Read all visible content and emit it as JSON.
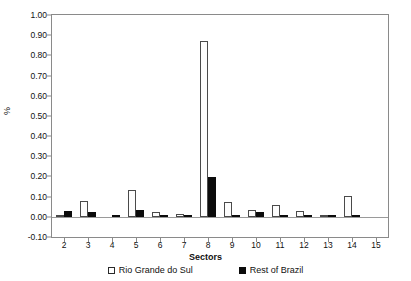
{
  "chart_data": {
    "type": "bar",
    "title": "",
    "xlabel": "Sectors",
    "ylabel": "%",
    "ylim": [
      -0.1,
      1.0
    ],
    "ytick_step": 0.1,
    "grid": false,
    "legend_position": "bottom",
    "categories": [
      "2",
      "3",
      "4",
      "5",
      "6",
      "7",
      "8",
      "9",
      "10",
      "11",
      "12",
      "13",
      "14",
      "15"
    ],
    "ytick_labels": [
      "1.00",
      "0.90",
      "0.80",
      "0.70",
      "0.60",
      "0.50",
      "0.40",
      "0.30",
      "0.20",
      "0.10",
      "0.00",
      "-0.10"
    ],
    "ytick_values": [
      1.0,
      0.9,
      0.8,
      0.7,
      0.6,
      0.5,
      0.4,
      0.3,
      0.2,
      0.1,
      0.0,
      -0.1
    ],
    "series": [
      {
        "name": "Rio Grande do Sul",
        "color": "#ffffff",
        "edge_color": "#4a4a4a",
        "values": [
          0.006,
          0.077,
          0.002,
          0.135,
          0.025,
          0.012,
          0.873,
          0.072,
          0.033,
          0.058,
          0.028,
          0.004,
          0.105,
          0.0
        ]
      },
      {
        "name": "Rest of Brazil",
        "color": "#0b0b0b",
        "edge_color": "#0b0b0b",
        "values": [
          0.031,
          0.022,
          0.01,
          0.032,
          0.005,
          0.004,
          0.198,
          0.005,
          0.022,
          0.006,
          0.005,
          0.006,
          0.006,
          0.0
        ]
      }
    ]
  },
  "legend": {
    "items": [
      {
        "label": "Rio Grande do Sul",
        "swatch": "hollow-square"
      },
      {
        "label": "Rest of Brazil",
        "swatch": "filled-square"
      }
    ]
  },
  "axes": {
    "x_title": "Sectors",
    "y_title": "%"
  }
}
